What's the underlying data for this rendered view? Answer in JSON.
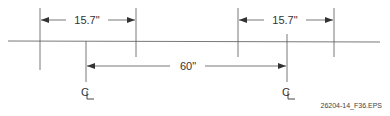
{
  "diagram": {
    "type": "dimensioned-layout",
    "colors": {
      "line": "#555555",
      "text": "#333333",
      "background": "#ffffff"
    },
    "dimensions": [
      {
        "id": "left-spacing",
        "label": "15.7\""
      },
      {
        "id": "right-spacing",
        "label": "15.7\""
      },
      {
        "id": "centerline-spacing",
        "label": "60\""
      }
    ],
    "centerlines": [
      {
        "id": "left-centerline",
        "symbol": "CL"
      },
      {
        "id": "right-centerline",
        "symbol": "CL"
      }
    ],
    "caption": "26204-14_F36.EPS"
  }
}
